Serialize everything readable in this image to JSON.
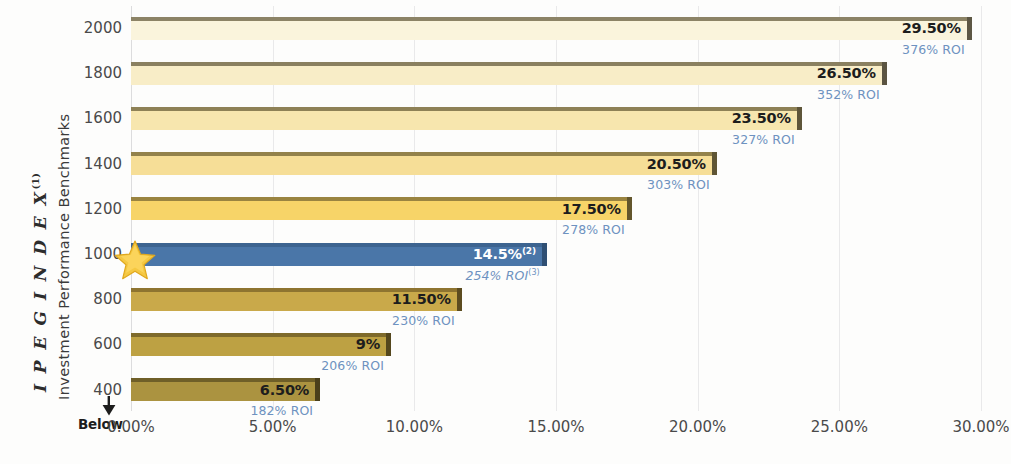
{
  "chart_data": {
    "type": "bar",
    "orientation": "horizontal",
    "title": "",
    "ylabel_primary": "I P E G  I N D E X",
    "ylabel_primary_superscript": "(1)",
    "ylabel_secondary": "Investment Performance Benchmarks",
    "xlabel": "",
    "xlim": [
      0,
      30
    ],
    "xtick_labels": [
      "0.00%",
      "5.00%",
      "10.00%",
      "15.00%",
      "20.00%",
      "25.00%",
      "30.00%"
    ],
    "xtick_values": [
      0,
      5,
      10,
      15,
      20,
      25,
      30
    ],
    "ytick_labels": [
      "2000",
      "1800",
      "1600",
      "1400",
      "1200",
      "1000",
      "800",
      "600",
      "400"
    ],
    "below_label": "Below",
    "grid": true,
    "legend": "none",
    "categories": [
      2000,
      1800,
      1600,
      1400,
      1200,
      1000,
      800,
      600,
      400
    ],
    "values": [
      29.5,
      26.5,
      23.5,
      20.5,
      17.5,
      14.5,
      11.5,
      9,
      6.5
    ],
    "bars": [
      {
        "index": "2000",
        "value": 29.5,
        "value_label": "29.50%",
        "value_superscript": "",
        "roi_label": "376% ROI",
        "roi_value": 376,
        "roi_superscript": "",
        "highlight": false,
        "fill": "#faf4dc",
        "edge": "#8c8366",
        "cap": "#5d5744",
        "label_color": "#1d1d1d"
      },
      {
        "index": "1800",
        "value": 26.5,
        "value_label": "26.50%",
        "value_superscript": "",
        "roi_label": "352% ROI",
        "roi_value": 352,
        "roi_superscript": "",
        "highlight": false,
        "fill": "#f8edc7",
        "edge": "#8a8060",
        "cap": "#5b5442",
        "label_color": "#1d1d1d"
      },
      {
        "index": "1600",
        "value": 23.5,
        "value_label": "23.50%",
        "value_superscript": "",
        "roi_label": "327% ROI",
        "roi_value": 327,
        "roi_superscript": "",
        "highlight": false,
        "fill": "#f7e6ae",
        "edge": "#8e8156",
        "cap": "#5e5539",
        "label_color": "#1d1d1d"
      },
      {
        "index": "1400",
        "value": 20.5,
        "value_label": "20.50%",
        "value_superscript": "",
        "roi_label": "303% ROI",
        "roi_value": 303,
        "roi_superscript": "",
        "highlight": false,
        "fill": "#f6de97",
        "edge": "#93824b",
        "cap": "#5f5535",
        "label_color": "#1d1d1d"
      },
      {
        "index": "1200",
        "value": 17.5,
        "value_label": "17.50%",
        "value_superscript": "",
        "roi_label": "278% ROI",
        "roi_value": 278,
        "roi_superscript": "",
        "highlight": false,
        "fill": "#f7d468",
        "edge": "#9a8440",
        "cap": "#63562c",
        "label_color": "#1d1d1d"
      },
      {
        "index": "1000",
        "value": 14.5,
        "value_label": "14.5%",
        "value_superscript": "(2)",
        "roi_label": "254% ROI",
        "roi_value": 254,
        "roi_superscript": "(3)",
        "highlight": true,
        "fill": "#4a76a8",
        "edge": "#3d6490",
        "cap": "#2f4f73",
        "label_color": "#ffffff"
      },
      {
        "index": "800",
        "value": 11.5,
        "value_label": "11.50%",
        "value_superscript": "",
        "roi_label": "230% ROI",
        "roi_value": 230,
        "roi_superscript": "",
        "highlight": false,
        "fill": "#c9a94a",
        "edge": "#8e7430",
        "cap": "#5c4c20",
        "label_color": "#1d1d1d"
      },
      {
        "index": "600",
        "value": 9,
        "value_label": "9%",
        "value_superscript": "",
        "roi_label": "206% ROI",
        "roi_value": 206,
        "roi_superscript": "",
        "highlight": false,
        "fill": "#bda143",
        "edge": "#7e6a2b",
        "cap": "#54471d",
        "label_color": "#1d1d1d"
      },
      {
        "index": "400",
        "value": 6.5,
        "value_label": "6.50%",
        "value_superscript": "",
        "roi_label": "182% ROI",
        "roi_value": 182,
        "roi_superscript": "",
        "highlight": false,
        "fill": "#ab9340",
        "edge": "#6f5f28",
        "cap": "#4a3f1b",
        "label_color": "#1d1d1d"
      }
    ],
    "marker": {
      "type": "star",
      "at_category": "1000",
      "color": "#f5c842"
    },
    "colors": {
      "roi_text": "#6e92c0",
      "highlight_bar": "#4a76a8",
      "gridline": "#e9e9ea",
      "tick_text": "#4a4a4a"
    }
  }
}
